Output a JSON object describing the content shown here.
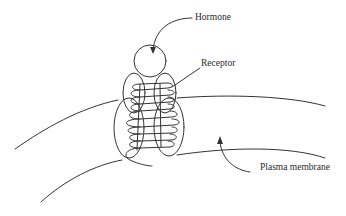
{
  "figure": {
    "type": "diagram",
    "labels": {
      "hormone": "Hormone",
      "receptor": "Receptor",
      "plasma_membrane": "Plasma membrane"
    },
    "colors": {
      "stroke": "#333333",
      "text": "#2a2a2a",
      "background": "#ffffff"
    }
  }
}
